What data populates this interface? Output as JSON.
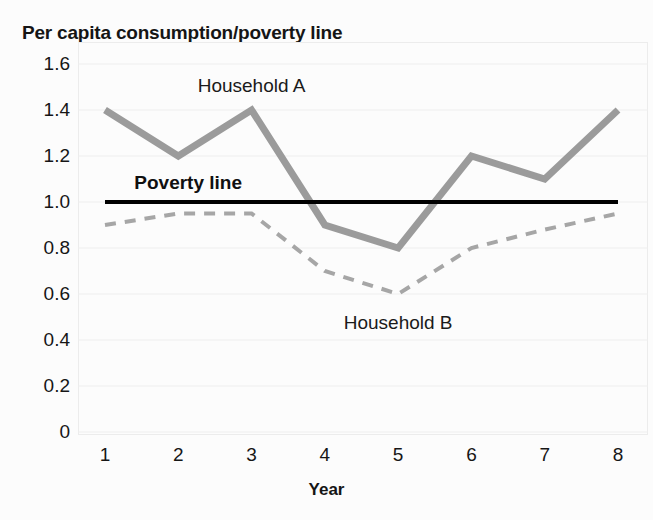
{
  "chart_data": {
    "type": "line",
    "title": "Per capita consumption/poverty line",
    "xlabel": "Year",
    "ylabel": "",
    "categories": [
      "1",
      "2",
      "3",
      "4",
      "5",
      "6",
      "7",
      "8"
    ],
    "x": [
      1,
      2,
      3,
      4,
      5,
      6,
      7,
      8
    ],
    "xlim": [
      1,
      8
    ],
    "ylim": [
      0,
      1.6
    ],
    "yticks": [
      "1.6",
      "1.4",
      "1.2",
      "1.0",
      "0.8",
      "0.6",
      "0.4",
      "0.2",
      "0"
    ],
    "ytick_values": [
      1.6,
      1.4,
      1.2,
      1.0,
      0.8,
      0.6,
      0.4,
      0.2,
      0
    ],
    "grid": true,
    "legend_position": "inline-annotations",
    "series": [
      {
        "name": "Household A",
        "style": "solid",
        "color": "#9b9b9b",
        "width": 7,
        "values": [
          1.4,
          1.2,
          1.4,
          0.9,
          0.8,
          1.2,
          1.1,
          1.4
        ]
      },
      {
        "name": "Household B",
        "style": "dashed",
        "color": "#a6a6a6",
        "width": 4,
        "values": [
          0.9,
          0.95,
          0.95,
          0.7,
          0.6,
          0.8,
          0.88,
          0.95
        ]
      }
    ],
    "reference_lines": [
      {
        "name": "Poverty line",
        "value": 1.0,
        "color": "#000000",
        "width": 4,
        "style": "solid"
      }
    ],
    "annotations": [
      {
        "text": "Household A",
        "x": 3.0,
        "y": 1.5
      },
      {
        "text": "Poverty line",
        "x": 1.4,
        "y": 1.08
      },
      {
        "text": "Household B",
        "x": 5.0,
        "y": 0.47
      }
    ]
  }
}
